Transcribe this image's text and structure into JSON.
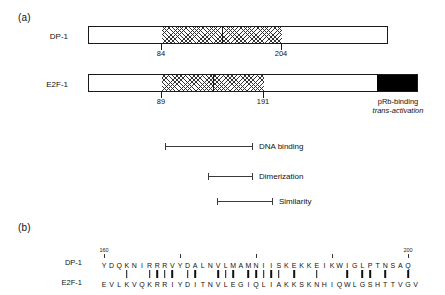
{
  "figure": {
    "panel_a_label": "(a)",
    "panel_b_label": "(b)"
  },
  "panel_a": {
    "proteins": [
      {
        "name": "DP-1",
        "domain_start_label": "84",
        "domain_end_label": "204",
        "has_black_block": false
      },
      {
        "name": "E2F-1",
        "domain_start_label": "89",
        "domain_end_label": "191",
        "has_black_block": true,
        "black_block_label_line1": "pRb-binding",
        "black_block_label_line2": "trans-activation"
      }
    ],
    "feature_ranges": [
      {
        "label": "DNA binding"
      },
      {
        "label": "Dimerization"
      },
      {
        "label": "Similarity"
      }
    ]
  },
  "panel_b": {
    "row1_name": "DP-1",
    "row2_name": "E2F-1",
    "row1_sequence": "YDQKNIRRRVYDALNVLMAMNIISKEKKEIKWIGLPTNSAQ",
    "row2_sequence": "EVLKVQKRRIYDITNVLEGIQLIAKKSKNHIQWLGSHTTVGV",
    "identity_mask": "00010011110110011101111101001000101101001001",
    "scale_ticks": [
      {
        "label": "160",
        "index": 0
      },
      {
        "label": "",
        "index": 10
      },
      {
        "label": "",
        "index": 20
      },
      {
        "label": "",
        "index": 30
      },
      {
        "label": "200",
        "index": 40
      }
    ]
  },
  "colors": {
    "outline": "#1a1a1a",
    "hatch": "#333333",
    "black_block": "#000000",
    "text": "#111111",
    "range_line": "#3a3a3a"
  }
}
